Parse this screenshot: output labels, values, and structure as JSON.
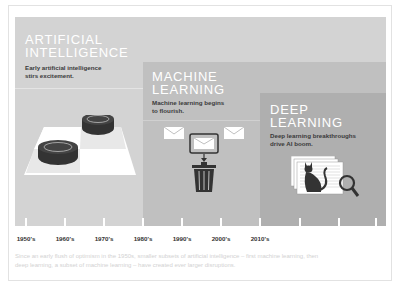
{
  "stages": [
    {
      "id": "ai",
      "title_line1": "ARTIFICIAL",
      "title_line2": "INTELLIGENCE",
      "description_line1": "Early artificial intelligence",
      "description_line2": "stirs excitement.",
      "icon": "checkers-board-icon",
      "color": "#d3d3d3"
    },
    {
      "id": "ml",
      "title_line1": "MACHINE",
      "title_line2": "LEARNING",
      "description_line1": "Machine learning begins",
      "description_line2": "to flourish.",
      "icon": "spam-filter-icon",
      "color": "#c0c0c0"
    },
    {
      "id": "dl",
      "title_line1": "DEEP",
      "title_line2": "LEARNING",
      "description_line1": "Deep learning breakthroughs",
      "description_line2": "drive AI boom.",
      "icon": "image-recognition-icon",
      "color": "#afafaf"
    }
  ],
  "timeline": {
    "labels": [
      "1950's",
      "1960's",
      "1970's",
      "1980's",
      "1990's",
      "2000's",
      "2010's"
    ],
    "tick_count": 10
  },
  "footer": {
    "line1": "Since an early flush of optimism in the 1950s, smaller subsets of artificial intelligence – first machine learning, then",
    "line2": "deep learning, a subset of machine learning – have created ever larger disruptions."
  }
}
